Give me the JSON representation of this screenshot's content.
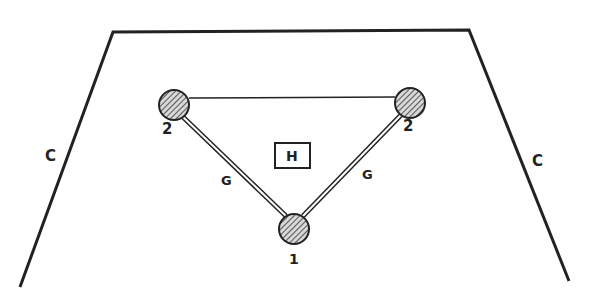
{
  "diagram": {
    "outline_label_left": "C",
    "outline_label_right": "C",
    "center_box_label": "H",
    "nodes": [
      {
        "id": "top-left",
        "label": "2",
        "x": 174,
        "y": 105
      },
      {
        "id": "top-right",
        "label": "2",
        "x": 410,
        "y": 103
      },
      {
        "id": "bottom",
        "label": "1",
        "x": 294,
        "y": 229
      }
    ],
    "edges": [
      {
        "from": "top-left",
        "to": "top-right",
        "style": "single",
        "label": ""
      },
      {
        "from": "top-left",
        "to": "bottom",
        "style": "double",
        "label": "G"
      },
      {
        "from": "top-right",
        "to": "bottom",
        "style": "double",
        "label": "G"
      }
    ],
    "colors": {
      "ink": "#222222",
      "background": "#ffffff"
    }
  }
}
